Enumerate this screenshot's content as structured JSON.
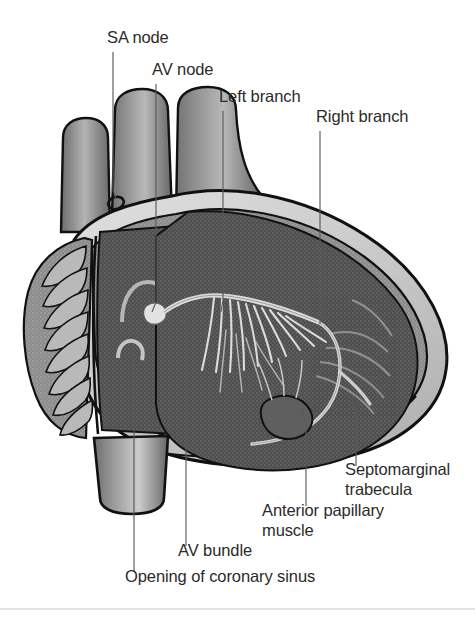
{
  "figure": {
    "background_color": "#ffffff",
    "width": 475,
    "height": 618,
    "divider_color": "#d8d8d8"
  },
  "palette": {
    "ink": "#111111",
    "label_text": "#2b2b2b",
    "leader_line": "#5a5a5a",
    "vessel_light": "#bdbdbd",
    "vessel_mid": "#8f8f8f",
    "vessel_dark": "#6e6e6e",
    "myocardium_light": "#cfcfcf",
    "myocardium_mid": "#9e9e9e",
    "chamber_dark": "#545454",
    "chamber_darker": "#454545",
    "conduction_fiber": "#dcdcdc",
    "valve_pale": "#d6d6d6"
  },
  "labels": [
    {
      "id": "sa-node",
      "text": "SA node",
      "x": 107,
      "y": 43,
      "anchor": "start",
      "leader": [
        [
          113,
          52
        ],
        [
          113,
          190
        ],
        [
          116,
          200
        ]
      ]
    },
    {
      "id": "av-node",
      "text": "AV node",
      "x": 152,
      "y": 75,
      "anchor": "start",
      "leader": [
        [
          156,
          84
        ],
        [
          156,
          300
        ],
        [
          153,
          312
        ]
      ]
    },
    {
      "id": "left-branch",
      "text": "Left branch",
      "x": 219,
      "y": 102,
      "anchor": "start",
      "leader": [
        [
          223,
          111
        ],
        [
          223,
          300
        ],
        [
          220,
          315
        ]
      ]
    },
    {
      "id": "right-branch",
      "text": "Right branch",
      "x": 316,
      "y": 122,
      "anchor": "start",
      "leader": [
        [
          320,
          131
        ],
        [
          320,
          322
        ]
      ]
    },
    {
      "id": "septomarginal-trabecula",
      "text": "Septomarginal",
      "text_line2": "trabecula",
      "x": 345,
      "y": 475,
      "y2": 495,
      "anchor": "start",
      "leader": [
        [
          356,
          468
        ],
        [
          356,
          420
        ],
        [
          352,
          398
        ]
      ]
    },
    {
      "id": "anterior-papillary-muscle",
      "text": "Anterior papillary",
      "text_line2": "muscle",
      "x": 262,
      "y": 516,
      "y2": 536,
      "anchor": "start",
      "leader": [
        [
          306,
          508
        ],
        [
          306,
          420
        ],
        [
          302,
          404
        ]
      ]
    },
    {
      "id": "av-bundle",
      "text": "AV bundle",
      "x": 178,
      "y": 556,
      "anchor": "start",
      "leader": [
        [
          186,
          548
        ],
        [
          186,
          330
        ],
        [
          183,
          318
        ]
      ]
    },
    {
      "id": "opening-of-coronary-sinus",
      "text": "Opening of coronary sinus",
      "x": 125,
      "y": 582,
      "anchor": "start",
      "leader": [
        [
          134,
          574
        ],
        [
          134,
          355
        ],
        [
          131,
          348
        ]
      ]
    }
  ],
  "structures": [
    {
      "id": "superior-vena-cava",
      "name": "Superior vena cava"
    },
    {
      "id": "aorta-stump",
      "name": "Aortic root stump"
    },
    {
      "id": "pulmonary-trunk",
      "name": "Pulmonary trunk"
    },
    {
      "id": "right-auricle",
      "name": "Right auricle with pectinate muscles"
    },
    {
      "id": "right-atrium",
      "name": "Right atrium interior"
    },
    {
      "id": "right-ventricle",
      "name": "Right ventricle interior"
    },
    {
      "id": "inferior-vena-cava",
      "name": "Inferior vena cava"
    },
    {
      "id": "sa-node-body",
      "name": "Sinuatrial node"
    },
    {
      "id": "av-node-body",
      "name": "Atrioventricular node"
    },
    {
      "id": "av-bundle-body",
      "name": "Atrioventricular bundle"
    },
    {
      "id": "left-branch-fibers",
      "name": "Left bundle branch fibers"
    },
    {
      "id": "right-branch-fiber",
      "name": "Right bundle branch"
    },
    {
      "id": "septomarginal-trabecula-body",
      "name": "Septomarginal trabecula"
    },
    {
      "id": "anterior-papillary-muscle-body",
      "name": "Anterior papillary muscle"
    },
    {
      "id": "coronary-sinus-opening",
      "name": "Opening of coronary sinus"
    },
    {
      "id": "crista-terminalis",
      "name": "Crista terminalis"
    },
    {
      "id": "epicardium",
      "name": "Epicardial outer band"
    },
    {
      "id": "myocardium",
      "name": "Myocardial wall band"
    }
  ]
}
